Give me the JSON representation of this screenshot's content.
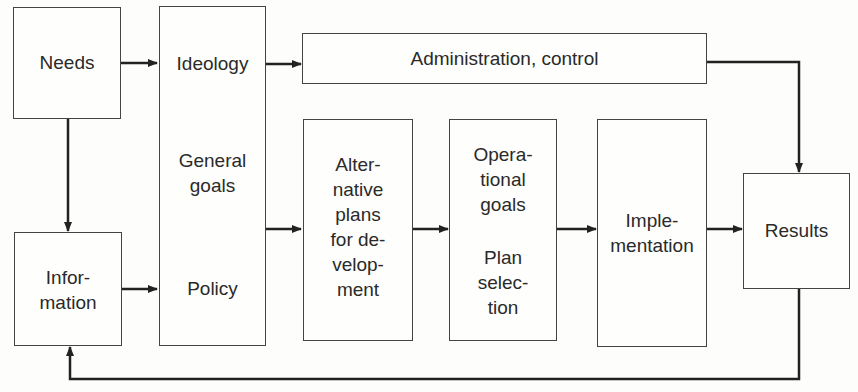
{
  "diagram": {
    "title": "",
    "nodes": {
      "needs": {
        "label": "Needs"
      },
      "information": {
        "label": "Infor-\nmation"
      },
      "policy_column": {
        "ideology": "Ideology",
        "general_goals": "General\ngoals",
        "policy": "Policy"
      },
      "administration": {
        "label": "Administration, control"
      },
      "alternative_plans": {
        "label": "Alter-\nnative\nplans\nfor de-\nvelop-\nment"
      },
      "operational": {
        "goals": "Opera-\ntional\ngoals",
        "plan_selection": "Plan\nselec-\ntion"
      },
      "implementation": {
        "label": "Imple-\nmentation"
      },
      "results": {
        "label": "Results"
      }
    },
    "edges": [
      {
        "from": "Needs",
        "to": "Ideology"
      },
      {
        "from": "Needs",
        "to": "Information"
      },
      {
        "from": "Information",
        "to": "Policy"
      },
      {
        "from": "Ideology",
        "to": "Administration, control"
      },
      {
        "from": "General goals",
        "to": "Alternative plans for development"
      },
      {
        "from": "Alternative plans for development",
        "to": "Operational goals / Plan selection"
      },
      {
        "from": "Operational goals / Plan selection",
        "to": "Implementation"
      },
      {
        "from": "Implementation",
        "to": "Results"
      },
      {
        "from": "Administration, control",
        "to": "Results"
      },
      {
        "from": "Results",
        "to": "Information",
        "type": "feedback"
      }
    ],
    "colors": {
      "line": "#222222",
      "box_border": "#444444",
      "background": "#fdfdfb"
    }
  }
}
